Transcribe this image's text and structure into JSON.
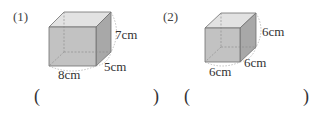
{
  "problems": [
    {
      "number": "(1)",
      "shape": "cuboid",
      "dimensions": {
        "length": "8cm",
        "width": "5cm",
        "height": "7cm"
      },
      "answer": {
        "open": "(",
        "close": ")",
        "value": ""
      }
    },
    {
      "number": "(2)",
      "shape": "cube",
      "dimensions": {
        "length": "6cm",
        "width": "6cm",
        "height": "6cm"
      },
      "answer": {
        "open": "(",
        "close": ")",
        "value": ""
      }
    }
  ],
  "colors": {
    "front": "#bdbdbd",
    "top": "#e0e0e0",
    "side": "#a9a9a9",
    "edge": "#6e6e6e"
  }
}
